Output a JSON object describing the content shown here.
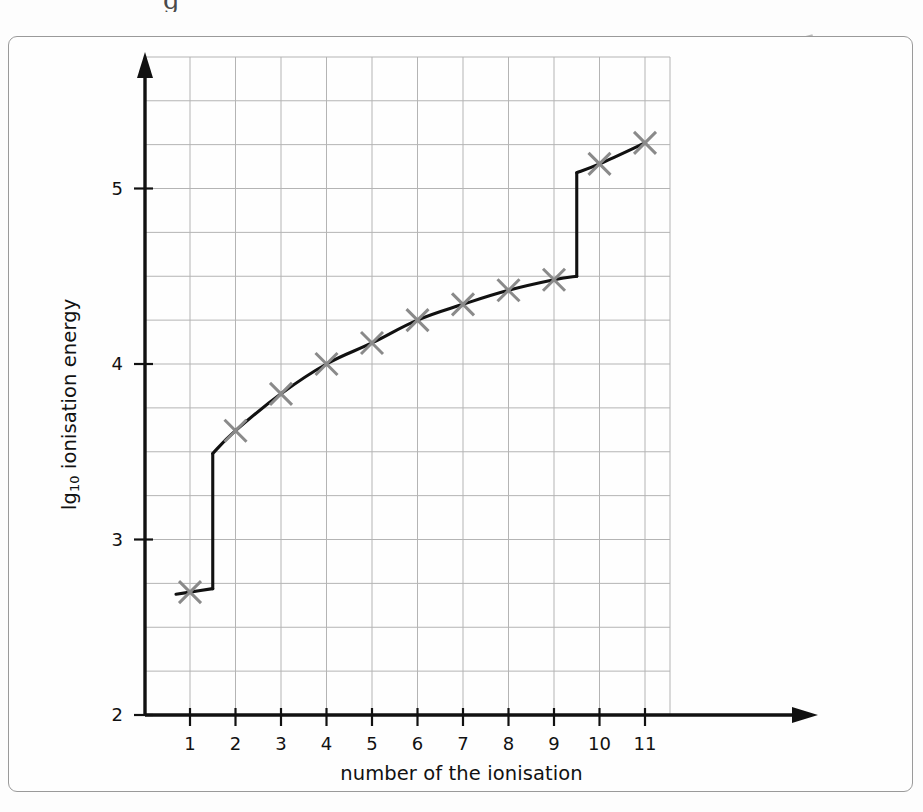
{
  "figure": {
    "frame_color": "#9a9a9a",
    "background": "#fefefe",
    "artifact_top_glyph": "g"
  },
  "chart_data": {
    "type": "line",
    "title": "",
    "subtitle": "",
    "xlabel": "number of the ionisation",
    "ylabel_prefix": "lg",
    "ylabel_subscript": "10",
    "ylabel_suffix": " ionisation energy",
    "ylabel": "lg10 ionisation energy",
    "x": [
      1,
      2,
      3,
      4,
      5,
      6,
      7,
      8,
      9,
      10,
      11
    ],
    "values": [
      2.7,
      3.62,
      3.83,
      4.0,
      4.12,
      4.25,
      4.34,
      4.42,
      4.48,
      5.14,
      5.26
    ],
    "xtick_labels": [
      "1",
      "2",
      "3",
      "4",
      "5",
      "6",
      "7",
      "8",
      "9",
      "10",
      "11"
    ],
    "ytick_labels": [
      "2",
      "3",
      "4",
      "5"
    ],
    "yticks": [
      2,
      3,
      4,
      5
    ],
    "xlim": [
      0.5,
      11.5
    ],
    "ylim": [
      2.0,
      5.57
    ],
    "grid": true,
    "grid_major_step_x": 1,
    "grid_major_step_y": 0.25,
    "grid_color": "#b4b4b4",
    "legend": "",
    "legend_position": "none",
    "marker": "cross",
    "marker_color": "#8a8a8a",
    "line_color": "#111111",
    "line_style": "step-with-smooth-segments",
    "step_risers": [
      {
        "x": 1.5,
        "from": 2.72,
        "to": 3.49
      },
      {
        "x": 9.5,
        "from": 4.5,
        "to": 5.09
      }
    ],
    "annotations": []
  }
}
